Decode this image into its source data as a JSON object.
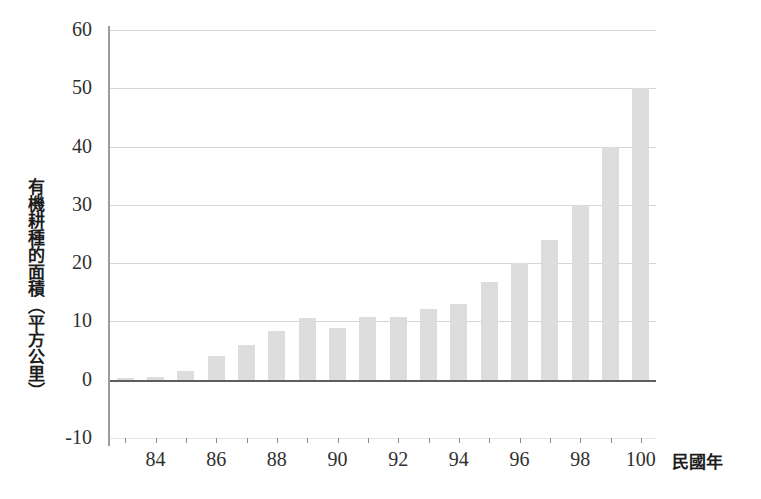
{
  "chart_data": {
    "type": "bar",
    "title": "",
    "subtitle": "",
    "xlabel": "民國年",
    "ylabel": "有機耕種的面積（平方公里）",
    "categories": [
      "83",
      "84",
      "85",
      "86",
      "87",
      "88",
      "89",
      "90",
      "91",
      "92",
      "93",
      "94",
      "95",
      "96",
      "97",
      "98",
      "99",
      "100"
    ],
    "values": [
      0.3,
      0.4,
      1.5,
      4.0,
      6.0,
      8.3,
      10.6,
      8.8,
      10.7,
      10.7,
      12.2,
      13.0,
      16.8,
      20.0,
      24.0,
      30.0,
      40.0,
      50.0
    ],
    "ylim": [
      -10,
      60
    ],
    "yticks": [
      -10,
      0,
      10,
      20,
      30,
      40,
      50,
      60
    ],
    "ytick_labels": [
      "-10",
      "0",
      "10",
      "20",
      "30",
      "40",
      "50",
      "60"
    ],
    "xticks_shown": [
      "84",
      "86",
      "88",
      "90",
      "92",
      "94",
      "96",
      "98",
      "100"
    ],
    "grid": true,
    "legend": "none",
    "legend_position": "none",
    "bar_color": "#dddddd",
    "gridline_color": "#d5d5d5",
    "axis_color": "#5d5d5d",
    "text_color": "#303030",
    "background_color": "#ffffff"
  }
}
